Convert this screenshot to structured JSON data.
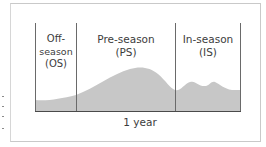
{
  "diagram": {
    "title": "",
    "phases": [
      {
        "id": "os",
        "line1": "Off-",
        "line2": "season",
        "line3": "(OS)"
      },
      {
        "id": "ps",
        "line1": "Pre-season",
        "line2": "(PS)"
      },
      {
        "id": "is",
        "line1": "In-season",
        "line2": "(IS)"
      }
    ],
    "axis_label": "1 year",
    "colors": {
      "fill": "#c7c7c7",
      "lines": "#5a5a5a",
      "frame": "#c9c9c9",
      "text": "#3c3c3c"
    }
  }
}
